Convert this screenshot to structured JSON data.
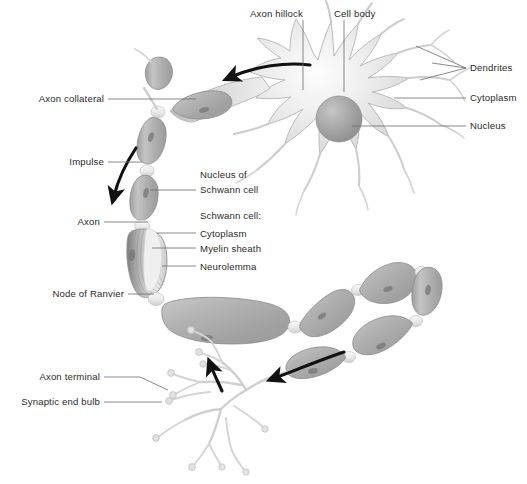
{
  "figure": {
    "background_color": "#ffffff",
    "text_color": "#2b2b2b",
    "leader_line_color": "#6a6a6a",
    "arrow_color": "#111111"
  },
  "labels": {
    "axon_hillock": "Axon hillock",
    "cell_body": "Cell body",
    "dendrites": "Dendrites",
    "cytoplasm_soma": "Cytoplasm",
    "nucleus": "Nucleus",
    "axon_collateral": "Axon collateral",
    "impulse": "Impulse",
    "nucleus_of_line1": "Nucleus of",
    "nucleus_of_line2": "Schwann cell",
    "schwann_cell_heading": "Schwann cell:",
    "schwann_cytoplasm": "Cytoplasm",
    "myelin_sheath": "Myelin sheath",
    "neurolemma": "Neurolemma",
    "axon": "Axon",
    "node_of_ranvier": "Node of Ranvier",
    "axon_terminal": "Axon terminal",
    "synaptic_end_bulb": "Synaptic end bulb"
  },
  "colors": {
    "soma_fill_light": "#f4f4f4",
    "soma_fill_mid": "#dcdcdc",
    "nucleus_fill": "#a0a0a0",
    "segment_fill": "#b0b0b0",
    "segment_highlight": "#d8d8d8",
    "node_fill": "#efefef",
    "terminal_fill": "#d9d9d9"
  },
  "annotations": {
    "impulse_arrow_count": 3,
    "impulse_direction": "from cell body toward axon terminals"
  }
}
